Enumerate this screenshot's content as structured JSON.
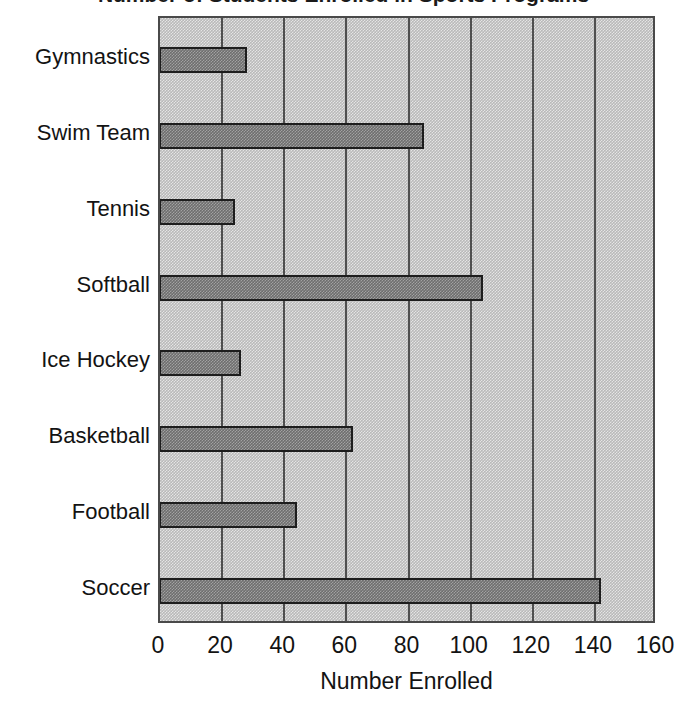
{
  "chart_data": {
    "type": "bar",
    "orientation": "horizontal",
    "title": "Number of Students Enrolled in Sports Programs",
    "title_visible": false,
    "categories": [
      "Soccer",
      "Football",
      "Basketball",
      "Ice Hockey",
      "Softball",
      "Tennis",
      "Swim Team",
      "Gymnastics"
    ],
    "values": [
      142,
      44,
      62,
      26,
      104,
      24,
      85,
      28
    ],
    "xlabel": "Number Enrolled",
    "ylabel": "",
    "xlim": [
      0,
      160
    ],
    "xticks": [
      0,
      20,
      40,
      60,
      80,
      100,
      120,
      140,
      160
    ],
    "xtick_labels": [
      "0",
      "20",
      "40",
      "60",
      "80",
      "100",
      "120",
      "140",
      "160"
    ],
    "grid": true,
    "grid_axis": "x",
    "legend": false,
    "bar_color": "#6e6e6e",
    "bar_edge_color": "#1d1d1d",
    "plot_background": "#b9b9b9",
    "gridline_color": "#4f4f4f",
    "text_color": "#131313"
  },
  "axis": {
    "x_title": "Number Enrolled"
  }
}
